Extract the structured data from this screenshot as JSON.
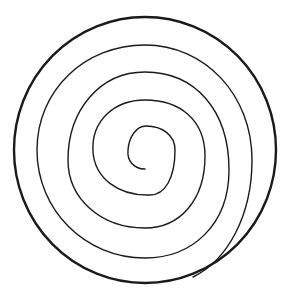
{
  "diagram": {
    "type": "spiral-in-circle",
    "background": "#ffffff",
    "stroke_color": "#1a1a1a",
    "circle": {
      "cx": 145,
      "cy": 150,
      "rx": 131,
      "ry": 133,
      "stroke_width": 2.4
    },
    "spiral": {
      "stroke_width": 1.4,
      "path": "M 145 169 C 133 169, 127 160, 128 150 C 129 136, 137 126, 146 126 C 162 126, 175 135, 175 150 C 175 178, 165 195, 150 195 C 118 196, 95 178, 93 152 C 91 120, 115 100, 145 100 C 180 100, 205 120, 205 156 C 205 200, 180 228, 145 228 C 100 228, 68 198, 68 160 C 68 110, 100 72, 145 72 C 195 72, 229 110, 229 170 C 229 225, 192 258, 145 258 C 85 258, 37 210, 37 150 C 37 90, 85 45, 145 45 C 205 45, 252 95, 252 160 C 252 215, 228 260, 193 277"
    }
  }
}
